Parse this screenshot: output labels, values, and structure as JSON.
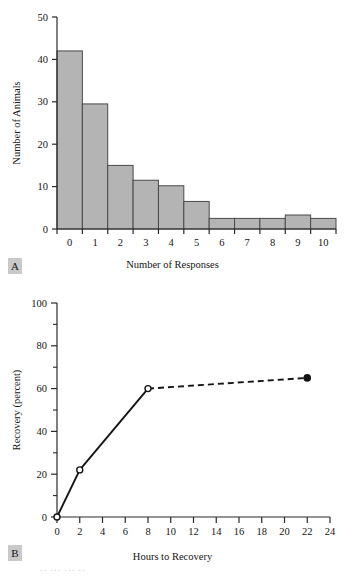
{
  "figure": {
    "panel_a_tag": "A",
    "panel_b_tag": "B",
    "partial_caption": "·· ··· ··· ··"
  },
  "chart_data": [
    {
      "type": "bar",
      "panel": "A",
      "title": "",
      "xlabel": "Number of Responses",
      "ylabel": "Number of Animals",
      "categories": [
        "0",
        "1",
        "2",
        "3",
        "4",
        "5",
        "6",
        "7",
        "8",
        "9",
        "10"
      ],
      "values": [
        42,
        29.5,
        15,
        11.5,
        10.2,
        6.5,
        2.5,
        2.5,
        2.5,
        3.3,
        2.5
      ],
      "xlim": [
        0,
        11
      ],
      "ylim": [
        0,
        50
      ],
      "ytick_labels": [
        "0",
        "10",
        "20",
        "30",
        "40",
        "50"
      ],
      "ytick_values": [
        0,
        10,
        20,
        30,
        40,
        50
      ],
      "xtick_labels": [
        "0",
        "1",
        "2",
        "3",
        "4",
        "5",
        "6",
        "7",
        "8",
        "9",
        "10"
      ],
      "grid": false,
      "legend": "none",
      "bar_fill": "#b4b4b4",
      "bar_stroke": "#4a4a4a",
      "axis_color": "#2a2a2a"
    },
    {
      "type": "line",
      "panel": "B",
      "title": "",
      "xlabel": "Hours to Recovery",
      "ylabel": "Recovery (percent)",
      "x": [
        0,
        2,
        8,
        22
      ],
      "values": [
        0,
        22,
        60,
        65
      ],
      "point_styles": [
        "open",
        "open",
        "open",
        "filled"
      ],
      "segment_styles": [
        "solid",
        "solid",
        "dashed"
      ],
      "xlim": [
        0,
        24
      ],
      "ylim": [
        0,
        100
      ],
      "ytick_labels": [
        "0",
        "20",
        "40",
        "60",
        "80",
        "100"
      ],
      "ytick_values": [
        0,
        20,
        40,
        60,
        80,
        100
      ],
      "yminor_ticks": [
        10,
        30,
        50,
        70,
        90
      ],
      "xtick_labels": [
        "0",
        "2",
        "4",
        "6",
        "8",
        "10",
        "12",
        "14",
        "16",
        "18",
        "20",
        "22",
        "24"
      ],
      "xtick_values": [
        0,
        2,
        4,
        6,
        8,
        10,
        12,
        14,
        16,
        18,
        20,
        22,
        24
      ],
      "grid": false,
      "legend": "none",
      "line_color": "#141414",
      "marker_fill": "#ffffff",
      "axis_color": "#2a2a2a"
    }
  ]
}
